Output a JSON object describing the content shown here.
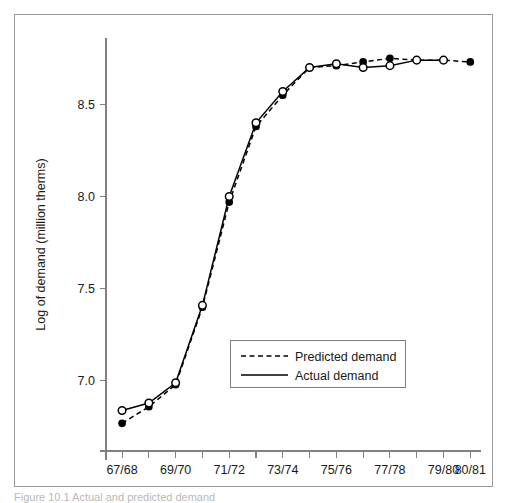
{
  "figure": {
    "caption": "Figure 10.1 Actual and predicted demand"
  },
  "chart_data": {
    "type": "line",
    "title": "",
    "xlabel": "",
    "ylabel": "Log of demand (million therms)",
    "ylim": [
      6.62,
      8.86
    ],
    "xlim": [
      -0.6,
      13.4
    ],
    "grid": false,
    "legend_position": "lower-center",
    "yticks": [
      7.0,
      7.5,
      8.0,
      8.5
    ],
    "ytick_labels": [
      "7.0",
      "7.5",
      "8.0",
      "8.5"
    ],
    "x": [
      0,
      1,
      2,
      3,
      4,
      5,
      6,
      7,
      8,
      9,
      10,
      11,
      12,
      13
    ],
    "xtick_labels": [
      "67/68",
      "",
      "69/70",
      "",
      "71/72",
      "",
      "73/74",
      "",
      "75/76",
      "",
      "77/78",
      "",
      "79/80",
      "80/81"
    ],
    "xtick_labels_visible": [
      "67/68",
      "69/70",
      "71/72",
      "73/74",
      "75/76",
      "77/78",
      "79/80",
      "80/81"
    ],
    "series": [
      {
        "name": "Predicted demand",
        "style": "dashed",
        "marker": "filled-circle",
        "values": [
          6.77,
          6.86,
          6.98,
          7.4,
          7.97,
          8.38,
          8.55,
          8.7,
          8.71,
          8.73,
          8.75,
          8.74,
          8.74,
          8.73
        ]
      },
      {
        "name": "Actual demand",
        "style": "solid",
        "marker": "open-circle",
        "values": [
          6.84,
          6.88,
          6.99,
          7.41,
          8.0,
          8.4,
          8.57,
          8.7,
          8.72,
          8.7,
          8.71,
          8.74,
          8.74,
          null
        ]
      }
    ],
    "legend": [
      {
        "label": "Predicted demand",
        "style": "dashed"
      },
      {
        "label": "Actual demand",
        "style": "solid"
      }
    ]
  },
  "colors": {
    "line": "#000000",
    "axis": "#808080",
    "frame": "#9a9a9a",
    "text": "#1a1a1a"
  }
}
